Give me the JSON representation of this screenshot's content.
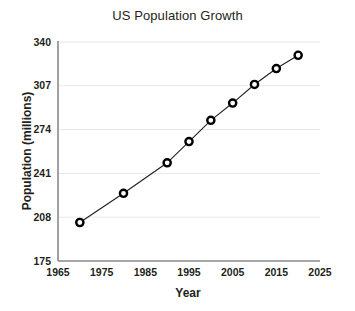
{
  "chart_data": {
    "type": "line",
    "title": "US Population Growth",
    "xlabel": "Year",
    "ylabel": "Population (millions)",
    "x": [
      1970,
      1980,
      1990,
      1995,
      2000,
      2005,
      2010,
      2015,
      2020
    ],
    "values": [
      204,
      226,
      249,
      265,
      281,
      294,
      308,
      320,
      330
    ],
    "series": [
      {
        "name": "US Population",
        "x": [
          1970,
          1980,
          1990,
          1995,
          2000,
          2005,
          2010,
          2015,
          2020
        ],
        "values": [
          204,
          226,
          249,
          265,
          281,
          294,
          308,
          320,
          330
        ]
      }
    ],
    "xlim": [
      1965,
      2025
    ],
    "ylim": [
      175,
      340
    ],
    "xticks": [
      1965,
      1975,
      1985,
      1995,
      2005,
      2015,
      2025
    ],
    "yticks": [
      175,
      208,
      241,
      274,
      307,
      340
    ],
    "xtick_labels": [
      "1965",
      "1975",
      "1985",
      "1995",
      "2005",
      "2015",
      "2025"
    ],
    "ytick_labels": [
      "175",
      "208",
      "241",
      "274",
      "307",
      "340"
    ],
    "grid": "horizontal",
    "legend": null,
    "marker": "circle-open",
    "line_color": "#231f20",
    "marker_color": "#000000",
    "marker_fill": "#ffffff",
    "grid_color": "#e8e8e8",
    "axis_color": "#8a8a8a",
    "background": "#ffffff"
  }
}
